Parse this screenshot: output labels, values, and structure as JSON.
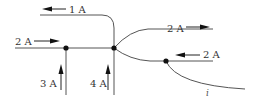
{
  "diagram": {
    "type": "circuit-junction",
    "labels": {
      "top_left": "1 A",
      "left": "2 A",
      "top_right": "2 A",
      "middle_right": "2 A",
      "bottom_left_1": "3 A",
      "bottom_left_2": "4 A",
      "unknown": "i"
    },
    "currents": [
      {
        "label": "1 A",
        "direction": "left",
        "branch": "top wire"
      },
      {
        "label": "2 A",
        "direction": "right",
        "branch": "left horizontal wire"
      },
      {
        "label": "3 A",
        "direction": "up",
        "branch": "left vertical wire"
      },
      {
        "label": "4 A",
        "direction": "up",
        "branch": "right vertical wire"
      },
      {
        "label": "2 A",
        "direction": "right",
        "branch": "upper right branch"
      },
      {
        "label": "2 A",
        "direction": "left",
        "branch": "lower right branch"
      },
      {
        "label": "i",
        "direction": "unknown",
        "branch": "bottom right curved wire"
      }
    ],
    "nodes": 3,
    "colors": {
      "wire": "#555555",
      "arrow": "#111111",
      "text": "#333333"
    }
  }
}
